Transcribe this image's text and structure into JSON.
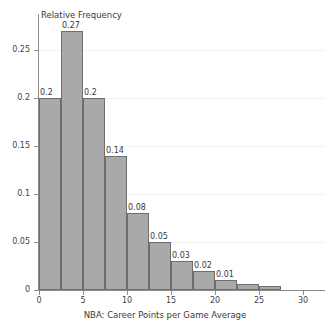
{
  "chart_data": {
    "type": "bar",
    "title": "",
    "subtitle": "",
    "xlabel": "NBA: Career Points per Game Average",
    "ylabel": "Relative Frequency",
    "xlim": [
      0,
      32.5
    ],
    "ylim": [
      0,
      0.285
    ],
    "xticks": [
      "0",
      "5",
      "10",
      "15",
      "20",
      "25",
      "30"
    ],
    "xtick_values": [
      0,
      5,
      10,
      15,
      20,
      25,
      30
    ],
    "yticks": [
      "0",
      "0.05",
      "0.1",
      "0.15",
      "0.2",
      "0.25"
    ],
    "ytick_values": [
      0,
      0.05,
      0.1,
      0.15,
      0.2,
      0.25
    ],
    "grid": "horizontal",
    "legend": "none",
    "bin_width": 2.5,
    "bin_edges": [
      0,
      2.5,
      5,
      7.5,
      10,
      12.5,
      15,
      17.5,
      20,
      22.5,
      25,
      27.5
    ],
    "categories": [
      "0-2.5",
      "2.5-5",
      "5-7.5",
      "7.5-10",
      "10-12.5",
      "12.5-15",
      "15-17.5",
      "17.5-20",
      "20-22.5",
      "22.5-25",
      "25-27.5"
    ],
    "values": [
      0.2,
      0.27,
      0.2,
      0.14,
      0.08,
      0.05,
      0.03,
      0.02,
      0.01,
      0.006,
      0.004
    ],
    "data_labels": [
      "0.2",
      "0.27",
      "0.2",
      "0.14",
      "0.08",
      "0.05",
      "0.03",
      "0.02",
      "0.01",
      "",
      ""
    ],
    "bar_color": "#a9a9a9",
    "bar_edge_color": "#6e6e6e",
    "grid_color": "#f0f0f0",
    "axis_color": "#8c8c8c",
    "text_color": "#3a3a3a",
    "background_color": "#ffffff"
  }
}
